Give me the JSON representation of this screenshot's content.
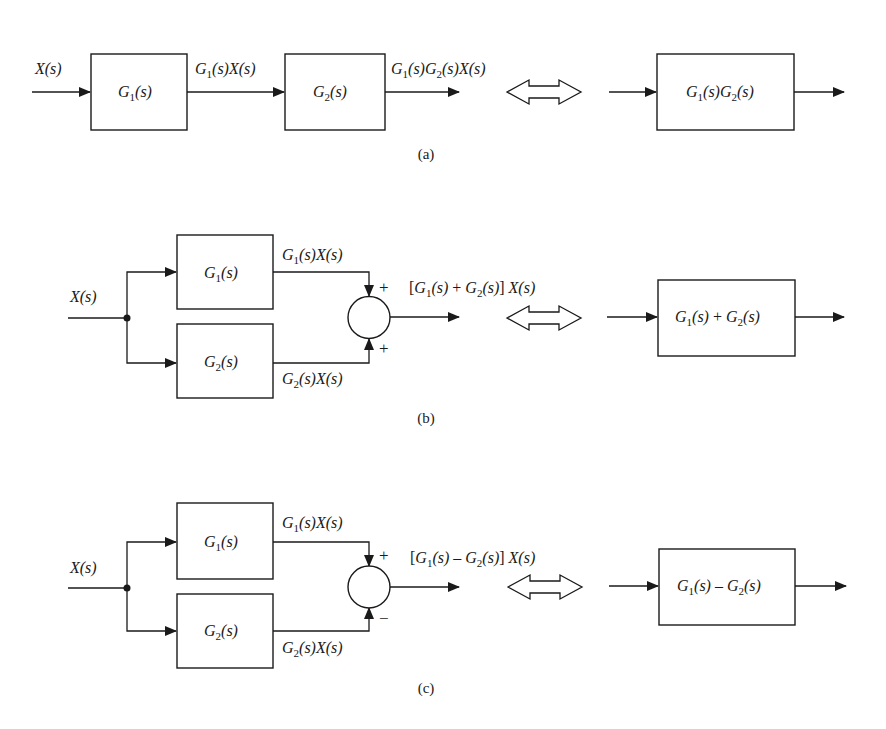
{
  "colors": {
    "line": "#1a1a1a",
    "background": "#ffffff"
  },
  "panels": {
    "a": {
      "caption": "(a)",
      "input": "X(s)",
      "blocks": [
        "G1(s)",
        "G2(s)"
      ],
      "intermediate": "G1(s)X(s)",
      "output": "G1(s)G2(s)X(s)",
      "equivalent_block": "G1(s)G2(s)",
      "equivalence_symbol": "double-arrow-icon"
    },
    "b": {
      "caption": "(b)",
      "input": "X(s)",
      "blocks": [
        "G1(s)",
        "G2(s)"
      ],
      "branch_outputs": [
        "G1(s)X(s)",
        "G2(s)X(s)"
      ],
      "summing_signs": [
        "+",
        "+"
      ],
      "output": "[G1(s) + G2(s)] X(s)",
      "equivalent_block": "G1(s) + G2(s)",
      "equivalence_symbol": "double-arrow-icon"
    },
    "c": {
      "caption": "(c)",
      "input": "X(s)",
      "blocks": [
        "G1(s)",
        "G2(s)"
      ],
      "branch_outputs": [
        "G1(s)X(s)",
        "G2(s)X(s)"
      ],
      "summing_signs": [
        "+",
        "−"
      ],
      "output": "[G1(s) − G2(s)] X(s)",
      "equivalent_block": "G1(s) − G2(s)",
      "equivalence_symbol": "double-arrow-icon"
    }
  }
}
